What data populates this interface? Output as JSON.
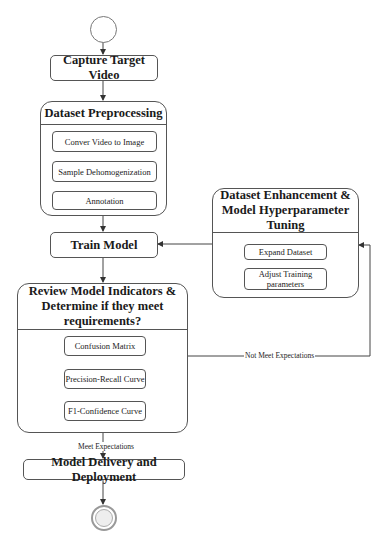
{
  "diagram": {
    "start": {
      "name": "start-node"
    },
    "end": {
      "name": "end-node"
    },
    "nodes": {
      "capture": "Capture Target Video",
      "preprocessing": {
        "title": "Dataset Preprocessing",
        "steps": [
          "Conver Video to Image",
          "Sample Dehomogenization",
          "Annotation"
        ]
      },
      "train": "Train Model",
      "review": {
        "title": "Review Model Indicators & Determine if they meet requirements?",
        "steps": [
          "Confusion Matrix",
          "Precision-Recall Curve",
          "F1-Confidence Curve"
        ]
      },
      "enhancement": {
        "title": "Dataset Enhancement & Model Hyperparameter Tuning",
        "steps": [
          "Expand Dataset",
          "Adjust Training parameters"
        ]
      },
      "delivery": "Model Delivery and Deployment"
    },
    "edges": {
      "meet_label": "Meet Expectations",
      "not_meet_label": "Not Meet Expectations"
    },
    "colors": {
      "stroke": "#555555",
      "fill": "#ffffff",
      "start_fill": "#ffffff",
      "end_fill": "#eeeeee"
    }
  }
}
